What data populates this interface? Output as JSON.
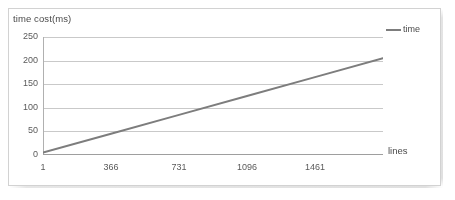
{
  "chart_data": {
    "type": "line",
    "title": "",
    "xlabel": "lines",
    "ylabel": "time cost(ms)",
    "xlim": [
      1,
      1826
    ],
    "ylim": [
      0,
      250
    ],
    "grid": "horizontal",
    "legend_position": "top-right",
    "x_ticks": [
      "1",
      "366",
      "731",
      "1096",
      "1461"
    ],
    "x_tick_values": [
      1,
      366,
      731,
      1096,
      1461
    ],
    "y_ticks": [
      "0",
      "50",
      "100",
      "150",
      "200",
      "250"
    ],
    "y_tick_values": [
      0,
      50,
      100,
      150,
      200,
      250
    ],
    "series": [
      {
        "name": "time",
        "color": "#7d7d7d",
        "x": [
          1,
          366,
          731,
          1096,
          1461,
          1826
        ],
        "values": [
          5,
          45,
          85,
          125,
          165,
          205
        ]
      }
    ]
  },
  "axes": {
    "y_title": "time cost(ms)",
    "x_title": "lines"
  },
  "legend": {
    "entries": [
      {
        "label": "time"
      }
    ]
  },
  "colors": {
    "series_line": "#7d7d7d",
    "gridline": "#c9c9c9",
    "axis": "#b0b0b0",
    "frame": "#d2d2d2",
    "text": "#4a4a4a"
  }
}
